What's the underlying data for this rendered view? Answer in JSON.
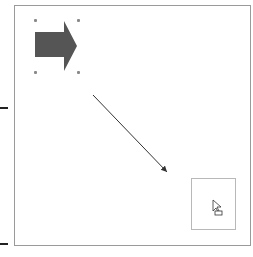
{
  "canvas": {
    "background": "#ffffff",
    "border_color": "#9a9a9a"
  },
  "shapes": {
    "block_arrow": {
      "name": "Right Arrow",
      "fill": "#555555",
      "selected": true
    },
    "connector_line": {
      "name": "Arrow line",
      "stroke": "#333333"
    },
    "drop_target": {
      "border": "#b8b8b8"
    }
  },
  "cursor": {
    "icon": "move-copy-cursor-icon"
  },
  "markers": {
    "color": "#222222"
  }
}
